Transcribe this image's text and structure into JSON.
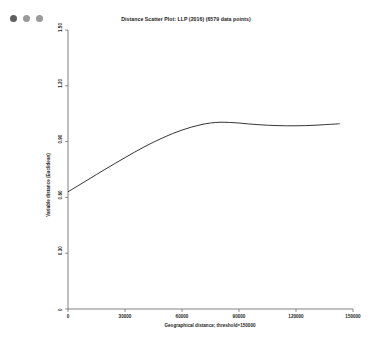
{
  "window": {
    "controls": [
      {
        "name": "close",
        "color": "#5e5e5e"
      },
      {
        "name": "minimize",
        "color": "#9a9a9a"
      },
      {
        "name": "zoom",
        "color": "#9a9a9a"
      }
    ]
  },
  "chart_data": {
    "type": "line",
    "title": "Distance Scatter Plot: LLP (2016) (6579 data points)",
    "xlabel": "Geographical distance; threshold=150000",
    "ylabel": "Variable distance (Euclidean)",
    "xlim": [
      0,
      150000
    ],
    "ylim": [
      0,
      1.5
    ],
    "grid": false,
    "legend": "none",
    "xticks": [
      0,
      30000,
      60000,
      90000,
      120000,
      150000
    ],
    "xticklabels": [
      "0",
      "30000",
      "60000",
      "90000",
      "120000",
      "150000"
    ],
    "yticks": [
      0,
      0.3,
      0.6,
      0.9,
      1.2,
      1.5
    ],
    "yticklabels": [
      "0",
      "0.30",
      "0.60",
      "0.90",
      "1.20",
      "1.50"
    ],
    "series": [
      {
        "name": "lowess-trend",
        "color": "#111111",
        "x": [
          0,
          5000,
          10000,
          15000,
          20000,
          25000,
          30000,
          35000,
          40000,
          45000,
          50000,
          55000,
          60000,
          65000,
          70000,
          75000,
          80000,
          85000,
          90000,
          95000,
          100000,
          105000,
          110000,
          115000,
          120000,
          125000,
          130000,
          135000,
          140000,
          143000
        ],
        "y": [
          0.63,
          0.661,
          0.692,
          0.723,
          0.754,
          0.784,
          0.814,
          0.843,
          0.871,
          0.897,
          0.921,
          0.943,
          0.962,
          0.978,
          0.991,
          1.0,
          1.004,
          1.003,
          1.0,
          0.995,
          0.991,
          0.988,
          0.986,
          0.985,
          0.985,
          0.986,
          0.988,
          0.991,
          0.994,
          0.996
        ]
      }
    ]
  }
}
